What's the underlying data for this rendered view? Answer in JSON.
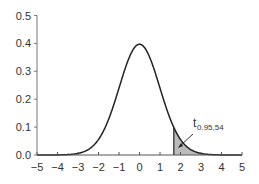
{
  "chart_data": {
    "type": "line",
    "title": "",
    "xlabel": "",
    "ylabel": "",
    "xlim": [
      -5,
      5
    ],
    "ylim": [
      0,
      0.5
    ],
    "x_ticks": [
      "−5",
      "−4",
      "−3",
      "−2",
      "−1",
      "0",
      "1",
      "2",
      "3",
      "4",
      "5"
    ],
    "y_ticks": [
      "0.0",
      "0.1",
      "0.2",
      "0.3",
      "0.4",
      "0.5"
    ],
    "grid": false,
    "legend": null,
    "series": [
      {
        "name": "t-distribution density (df=54)",
        "x": [
          -5,
          -4,
          -3,
          -2.5,
          -2,
          -1.5,
          -1,
          -0.5,
          0,
          0.5,
          1,
          1.5,
          2,
          2.5,
          3,
          4,
          5
        ],
        "y": [
          0.0,
          0.0003,
          0.0052,
          0.0186,
          0.0555,
          0.1306,
          0.2411,
          0.3514,
          0.3971,
          0.3514,
          0.2411,
          0.1306,
          0.0555,
          0.0186,
          0.0052,
          0.0003,
          0.0
        ]
      }
    ],
    "shaded_region": {
      "from": 1.674,
      "to": 5,
      "color": "#bbbbbb"
    },
    "annotations": [
      {
        "text": "t",
        "subscript": "0.95,54",
        "points_to_x": 1.674
      }
    ]
  }
}
